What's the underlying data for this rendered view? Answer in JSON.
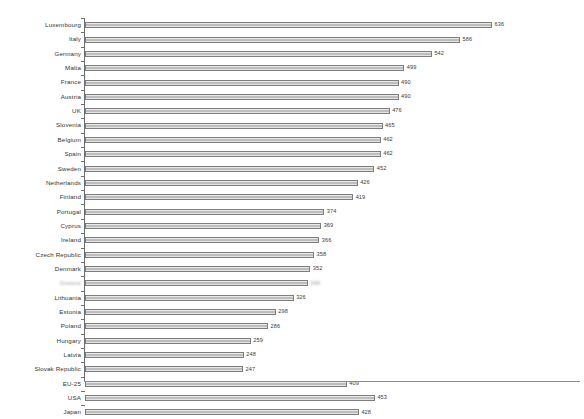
{
  "chart_data": {
    "type": "bar",
    "orientation": "horizontal",
    "title": "",
    "xlabel": "",
    "ylabel": "",
    "xlim": [
      0,
      700
    ],
    "grid": false,
    "legend": "none",
    "value_labels": true,
    "categories": [
      "Luxembourg",
      "Italy",
      "Germany",
      "Malta",
      "France",
      "Austria",
      "UK",
      "Slovenia",
      "Belgium",
      "Spain",
      "Sweden",
      "Netherlands",
      "Finland",
      "Portugal",
      "Cyprus",
      "Ireland",
      "Czech Republic",
      "Denmark",
      "Greece",
      "Lithuania",
      "Estonia",
      "Poland",
      "Hungary",
      "Latvia",
      "Slovak Republic",
      "EU-25",
      "USA",
      "Japan"
    ],
    "values": [
      636,
      586,
      542,
      499,
      490,
      490,
      476,
      465,
      462,
      462,
      452,
      426,
      419,
      374,
      369,
      366,
      358,
      352,
      348,
      326,
      298,
      286,
      259,
      248,
      247,
      409,
      453,
      428
    ],
    "value_label_text": [
      "636",
      "586",
      "542",
      "499",
      "490",
      "490",
      "476",
      "465",
      "462",
      "462",
      "452",
      "426",
      "419",
      "374",
      "369",
      "366",
      "358",
      "352",
      "348",
      "326",
      "298",
      "286",
      "259",
      "248",
      "247",
      "409",
      "453",
      "428"
    ],
    "blurred_rows": [
      18
    ],
    "colors": {
      "bar_fill": "#c9c9c9",
      "bar_edge": "#7d7d7d",
      "axis": "#6e6e6e",
      "text": "#333333",
      "background": "#ffffff"
    }
  }
}
